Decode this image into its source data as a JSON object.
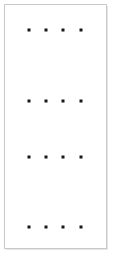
{
  "canvas": {
    "width": 113,
    "height": 261,
    "background": "#ffffff"
  },
  "card": {
    "name": "dot-grid-panel",
    "x": 4,
    "y": 4,
    "width": 103,
    "height": 245,
    "background": "#ffffff",
    "border_color": "#c9c9c9",
    "border_width": 1,
    "shadow_color": "#e6e6e6"
  },
  "dot_grid": {
    "dot_color": "#171717",
    "dot_size": 3,
    "rows": 4,
    "columns": 4,
    "column_x": [
      28,
      45,
      62,
      80
    ],
    "row_y": [
      29,
      100,
      156,
      226
    ],
    "points": [
      {
        "row": 0,
        "col": 0,
        "x": 28,
        "y": 29
      },
      {
        "row": 0,
        "col": 1,
        "x": 45,
        "y": 29
      },
      {
        "row": 0,
        "col": 2,
        "x": 62,
        "y": 29
      },
      {
        "row": 0,
        "col": 3,
        "x": 80,
        "y": 29
      },
      {
        "row": 1,
        "col": 0,
        "x": 28,
        "y": 100
      },
      {
        "row": 1,
        "col": 1,
        "x": 45,
        "y": 100
      },
      {
        "row": 1,
        "col": 2,
        "x": 62,
        "y": 100
      },
      {
        "row": 1,
        "col": 3,
        "x": 80,
        "y": 100
      },
      {
        "row": 2,
        "col": 0,
        "x": 28,
        "y": 156
      },
      {
        "row": 2,
        "col": 1,
        "x": 45,
        "y": 156
      },
      {
        "row": 2,
        "col": 2,
        "x": 62,
        "y": 156
      },
      {
        "row": 2,
        "col": 3,
        "x": 80,
        "y": 156
      },
      {
        "row": 3,
        "col": 0,
        "x": 28,
        "y": 226
      },
      {
        "row": 3,
        "col": 1,
        "x": 45,
        "y": 226
      },
      {
        "row": 3,
        "col": 2,
        "x": 62,
        "y": 226
      },
      {
        "row": 3,
        "col": 3,
        "x": 80,
        "y": 226
      }
    ]
  }
}
